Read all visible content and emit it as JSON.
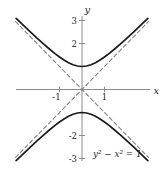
{
  "chart_data": {
    "type": "line",
    "equation": "y^2 - x^2 = 1",
    "equation_label": "y² − x² = 1",
    "xlabel": "x",
    "ylabel": "y",
    "xlim": [
      -3,
      3.1
    ],
    "ylim": [
      -3.3,
      3.4
    ],
    "grid": false,
    "legend": false,
    "x_ticks": [
      {
        "value": -1,
        "label": "-1"
      },
      {
        "value": 1,
        "label": "1"
      }
    ],
    "y_ticks": [
      {
        "value": 3,
        "label": "3"
      },
      {
        "value": 2,
        "label": "2"
      },
      {
        "value": -2,
        "label": "-2"
      },
      {
        "value": -3,
        "label": "-3"
      }
    ],
    "style": {
      "background": "#ffffff",
      "axis_color": "#8c8c8c",
      "curve_color": "#1b1b1b",
      "asymptote_color": "#7f7f7f",
      "text_color": "#1f1f1f"
    },
    "series": [
      {
        "name": "hyperbola-upper-branch",
        "type": "solid",
        "color": "#1b1b1b",
        "x": [
          -2.93,
          -2.6,
          -2.3,
          -2.0,
          -1.7,
          -1.45,
          -1.2,
          -1.0,
          -0.8,
          -0.6,
          -0.4,
          -0.2,
          0,
          0.2,
          0.4,
          0.6,
          0.8,
          1.0,
          1.2,
          1.45,
          1.7,
          2.0,
          2.3,
          2.6,
          2.93
        ],
        "y": [
          3.096,
          2.786,
          2.508,
          2.236,
          1.972,
          1.761,
          1.562,
          1.414,
          1.281,
          1.166,
          1.077,
          1.02,
          1.0,
          1.02,
          1.077,
          1.166,
          1.281,
          1.414,
          1.562,
          1.761,
          1.972,
          2.236,
          2.508,
          2.786,
          3.096
        ]
      },
      {
        "name": "hyperbola-lower-branch",
        "type": "solid",
        "color": "#1b1b1b",
        "x": [
          -2.93,
          -2.6,
          -2.3,
          -2.0,
          -1.7,
          -1.45,
          -1.2,
          -1.0,
          -0.8,
          -0.6,
          -0.4,
          -0.2,
          0,
          0.2,
          0.4,
          0.6,
          0.8,
          1.0,
          1.2,
          1.45,
          1.7,
          2.0,
          2.3,
          2.6,
          2.93
        ],
        "y": [
          -3.096,
          -2.786,
          -2.508,
          -2.236,
          -1.972,
          -1.761,
          -1.562,
          -1.414,
          -1.281,
          -1.166,
          -1.077,
          -1.02,
          -1.0,
          -1.02,
          -1.077,
          -1.166,
          -1.281,
          -1.414,
          -1.562,
          -1.761,
          -1.972,
          -2.236,
          -2.508,
          -2.786,
          -3.096
        ]
      },
      {
        "name": "asymptote-y-equals-x",
        "type": "dashed",
        "color": "#7f7f7f",
        "x": [
          -2.95,
          2.95
        ],
        "y": [
          -2.95,
          2.95
        ]
      },
      {
        "name": "asymptote-y-equals-negative-x",
        "type": "dashed",
        "color": "#7f7f7f",
        "x": [
          -2.95,
          2.95
        ],
        "y": [
          2.95,
          -2.95
        ]
      }
    ]
  }
}
